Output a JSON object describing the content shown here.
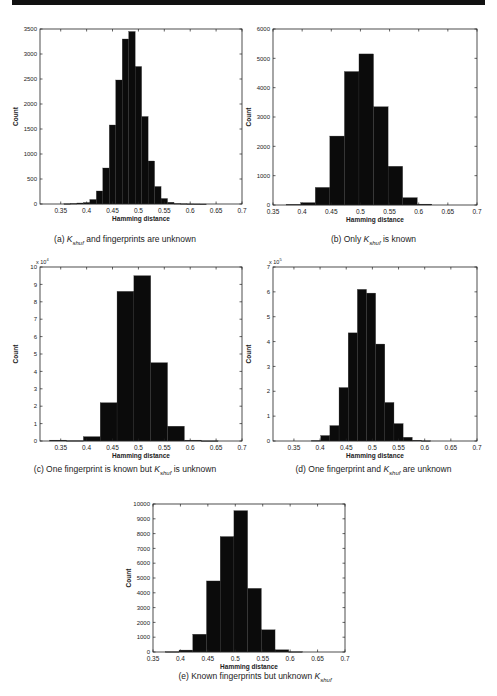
{
  "page": {
    "top_rule_color": "#111111"
  },
  "chart_data": [
    {
      "id": "a",
      "type": "bar",
      "title": "",
      "caption_prefix": "(a) ",
      "caption_k": "K",
      "caption_sub": "shuf",
      "caption_suffix": " and fingerprints are unknown",
      "xlabel": "Hamming distance",
      "ylabel": "Count",
      "y_multiplier": "",
      "xlim": [
        0.31,
        0.7
      ],
      "ylim": [
        0,
        3500
      ],
      "xticks": [
        0.35,
        0.4,
        0.45,
        0.5,
        0.55,
        0.6,
        0.65,
        0.7
      ],
      "xtick_labels": [
        "0.35",
        "0.4",
        "0.45",
        "0.5",
        "0.55",
        "0.6",
        "0.65",
        "0.7"
      ],
      "yticks": [
        0,
        500,
        1000,
        1500,
        2000,
        2500,
        3000,
        3500
      ],
      "ytick_labels": [
        "0",
        "500",
        "1000",
        "1500",
        "2000",
        "2500",
        "3000",
        "3500"
      ],
      "bin_width": 0.0125,
      "x": [
        0.3625,
        0.375,
        0.3875,
        0.4,
        0.4125,
        0.425,
        0.4375,
        0.45,
        0.4625,
        0.475,
        0.4875,
        0.5,
        0.5125,
        0.525,
        0.5375,
        0.55,
        0.5625,
        0.575,
        0.5875,
        0.6,
        0.6125,
        0.625
      ],
      "values": [
        5,
        10,
        20,
        30,
        90,
        260,
        720,
        1580,
        2480,
        3300,
        3450,
        2750,
        1750,
        860,
        350,
        110,
        35,
        10,
        5,
        2,
        1,
        0
      ],
      "grid": false
    },
    {
      "id": "b",
      "type": "bar",
      "caption_prefix": "(b) Only ",
      "caption_k": "K",
      "caption_sub": "shuf",
      "caption_suffix": " is known",
      "xlabel": "Hamming distance",
      "ylabel": "Count",
      "y_multiplier": "",
      "xlim": [
        0.35,
        0.7
      ],
      "ylim": [
        0,
        6000
      ],
      "xticks": [
        0.35,
        0.4,
        0.45,
        0.5,
        0.55,
        0.6,
        0.65,
        0.7
      ],
      "xtick_labels": [
        "0.35",
        "0.4",
        "0.45",
        "0.5",
        "0.55",
        "0.6",
        "0.65",
        "0.7"
      ],
      "yticks": [
        0,
        1000,
        2000,
        3000,
        4000,
        5000,
        6000
      ],
      "ytick_labels": [
        "0",
        "1000",
        "2000",
        "3000",
        "4000",
        "5000",
        "6000"
      ],
      "bin_width": 0.025,
      "x": [
        0.385,
        0.41,
        0.435,
        0.46,
        0.485,
        0.51,
        0.535,
        0.56,
        0.585,
        0.61
      ],
      "values": [
        20,
        80,
        600,
        2350,
        4550,
        5150,
        3350,
        1320,
        250,
        30
      ],
      "grid": false
    },
    {
      "id": "c",
      "type": "bar",
      "caption_prefix": "(c) One fingerprint is known but ",
      "caption_k": "K",
      "caption_sub": "shuf",
      "caption_suffix": " is unknown",
      "xlabel": "Hamming distance",
      "ylabel": "Count",
      "y_multiplier": "x 10",
      "y_exponent": "4",
      "xlim": [
        0.31,
        0.7
      ],
      "ylim": [
        0,
        10
      ],
      "xticks": [
        0.35,
        0.4,
        0.45,
        0.5,
        0.55,
        0.6,
        0.65,
        0.7
      ],
      "xtick_labels": [
        "0.35",
        "0.4",
        "0.45",
        "0.5",
        "0.55",
        "0.6",
        "0.65",
        "0.7"
      ],
      "yticks": [
        0,
        1,
        2,
        3,
        4,
        5,
        6,
        7,
        8,
        9,
        10
      ],
      "ytick_labels": [
        "0",
        "1",
        "2",
        "3",
        "4",
        "5",
        "6",
        "7",
        "8",
        "9",
        "10"
      ],
      "bin_width": 0.0325,
      "x": [
        0.345,
        0.3775,
        0.41,
        0.4425,
        0.475,
        0.5075,
        0.54,
        0.5725,
        0.605,
        0.6375
      ],
      "values": [
        0.05,
        0.02,
        0.25,
        2.2,
        8.6,
        9.5,
        4.5,
        0.85,
        0.05,
        0.01
      ],
      "grid": false
    },
    {
      "id": "d",
      "type": "bar",
      "caption_prefix": "(d) One fingerprint and ",
      "caption_k": "K",
      "caption_sub": "shuf",
      "caption_suffix": " are unknown",
      "xlabel": "Hamming distance",
      "ylabel": "Count",
      "y_multiplier": "x 10",
      "y_exponent": "5",
      "xlim": [
        0.31,
        0.7
      ],
      "ylim": [
        0,
        7
      ],
      "xticks": [
        0.35,
        0.4,
        0.45,
        0.5,
        0.55,
        0.6,
        0.65,
        0.7
      ],
      "xtick_labels": [
        "0.35",
        "0.4",
        "0.45",
        "0.5",
        "0.55",
        "0.6",
        "0.65",
        "0.7"
      ],
      "yticks": [
        0,
        1,
        2,
        3,
        4,
        5,
        6,
        7
      ],
      "ytick_labels": [
        "0",
        "1",
        "2",
        "3",
        "4",
        "5",
        "6",
        "7"
      ],
      "bin_width": 0.0175,
      "x": [
        0.3925,
        0.41,
        0.4275,
        0.445,
        0.4625,
        0.48,
        0.4975,
        0.515,
        0.5325,
        0.55,
        0.5675,
        0.585,
        0.6025
      ],
      "values": [
        0.02,
        0.22,
        0.62,
        2.15,
        4.35,
        6.1,
        5.95,
        3.9,
        1.55,
        0.7,
        0.15,
        0.03,
        0.01
      ],
      "grid": false
    },
    {
      "id": "e",
      "type": "bar",
      "caption_prefix": "(e) Known fingerprints but unknown ",
      "caption_k": "K",
      "caption_sub": "shuf",
      "caption_suffix": "",
      "xlabel": "Hamming distance",
      "ylabel": "Count",
      "y_multiplier": "",
      "xlim": [
        0.35,
        0.7
      ],
      "ylim": [
        0,
        10000
      ],
      "xticks": [
        0.35,
        0.4,
        0.45,
        0.5,
        0.55,
        0.6,
        0.65,
        0.7
      ],
      "xtick_labels": [
        "0.35",
        "0.4",
        "0.45",
        "0.5",
        "0.55",
        "0.6",
        "0.65",
        "0.7"
      ],
      "yticks": [
        0,
        1000,
        2000,
        3000,
        4000,
        5000,
        6000,
        7000,
        8000,
        9000,
        10000
      ],
      "ytick_labels": [
        "0",
        "1000",
        "2000",
        "3000",
        "4000",
        "5000",
        "6000",
        "7000",
        "8000",
        "9000",
        "10000"
      ],
      "bin_width": 0.025,
      "x": [
        0.385,
        0.41,
        0.435,
        0.46,
        0.485,
        0.51,
        0.535,
        0.56,
        0.585,
        0.61
      ],
      "values": [
        20,
        130,
        1200,
        4800,
        7800,
        9550,
        4300,
        1500,
        150,
        20
      ],
      "grid": false
    }
  ]
}
